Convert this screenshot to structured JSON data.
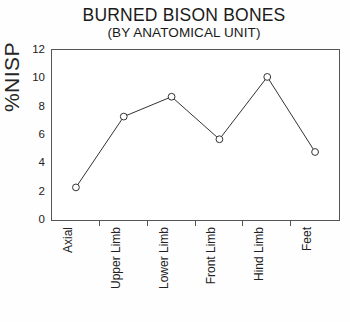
{
  "chart_data": {
    "type": "line",
    "title": "BURNED BISON BONES",
    "subtitle": "(BY ANATOMICAL UNIT)",
    "xlabel": "",
    "ylabel": "%NISP",
    "categories": [
      "Axial",
      "Upper Limb",
      "Lower Limb",
      "Front Limb",
      "Hind Limb",
      "Feet"
    ],
    "values": [
      2.3,
      7.3,
      8.7,
      5.7,
      10.1,
      4.8
    ],
    "ylim": [
      0,
      12
    ],
    "yticks": [
      0,
      2,
      4,
      6,
      8,
      10,
      12
    ],
    "ytick_labels": [
      "0",
      "2",
      "4",
      "6",
      "8",
      "10",
      "12"
    ],
    "grid": false,
    "legend": null,
    "marker": "open-circle",
    "line_color": "#333333",
    "marker_fill": "#ffffff",
    "marker_edge": "#333333",
    "frame_color": "#555555",
    "background": "#ffffff"
  }
}
